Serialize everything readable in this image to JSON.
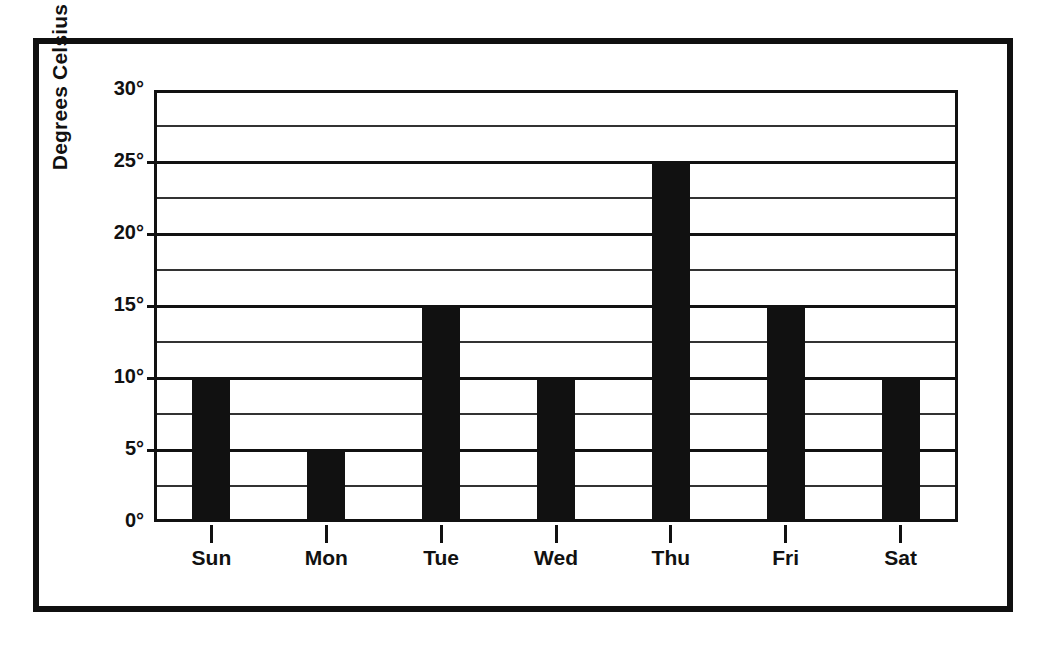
{
  "chart_data": {
    "type": "bar",
    "title": "",
    "xlabel": "",
    "ylabel": "Degrees Celsius",
    "categories": [
      "Sun",
      "Mon",
      "Tue",
      "Wed",
      "Thu",
      "Fri",
      "Sat"
    ],
    "values": [
      10,
      5,
      15,
      10,
      25,
      15,
      10
    ],
    "ylim": [
      0,
      30
    ],
    "ytick_labels": [
      "0°",
      "5°",
      "10°",
      "15°",
      "20°",
      "25°",
      "30°"
    ],
    "ytick_values": [
      0,
      5,
      10,
      15,
      20,
      25,
      30
    ],
    "minor_gridline_values": [
      2.5,
      7.5,
      12.5,
      17.5,
      22.5,
      27.5
    ],
    "grid": true,
    "legend": false,
    "legend_position": "none",
    "bar_color": "#111111",
    "frame_color": "#101010",
    "background_color": "#ffffff"
  }
}
